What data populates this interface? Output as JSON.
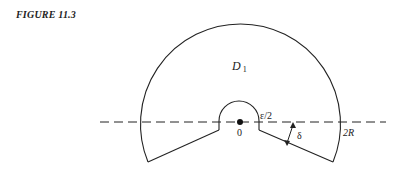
{
  "figure": {
    "title": "FIGURE 11.3",
    "labels": {
      "region": "D",
      "region_subscript": "1",
      "origin": "0",
      "small_radius": "ε/2",
      "angle": "δ",
      "outer_radius": "2R"
    }
  }
}
